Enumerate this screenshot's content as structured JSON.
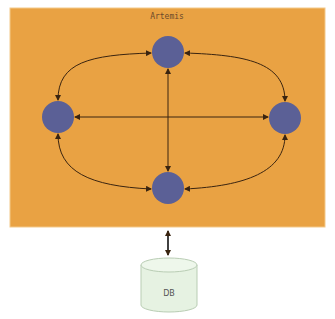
{
  "diagram": {
    "container": {
      "title": "Artemis",
      "fill": "#E9A243",
      "border": "#F3C98A",
      "x": 10,
      "y": 8,
      "width": 315,
      "height": 219
    },
    "nodes": [
      {
        "id": "top",
        "cx": 168,
        "cy": 52,
        "r": 16,
        "fill": "#5B6096"
      },
      {
        "id": "left",
        "cx": 58,
        "cy": 117,
        "r": 16,
        "fill": "#5B6096"
      },
      {
        "id": "right",
        "cx": 285,
        "cy": 118,
        "r": 16,
        "fill": "#5B6096"
      },
      {
        "id": "bottom",
        "cx": 168,
        "cy": 188,
        "r": 16,
        "fill": "#5B6096"
      }
    ],
    "edge_color": "#3a2410",
    "database": {
      "label": "DB",
      "fill": "#E6F2E2",
      "stroke": "#B9CDB4"
    }
  }
}
